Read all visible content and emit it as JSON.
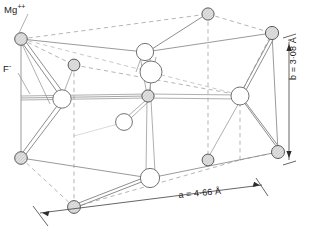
{
  "figure": {
    "labels": {
      "cation": "Mg",
      "cation_charge": "++",
      "anion": "F",
      "anion_charge": "-",
      "axis_a": "a = 4·66 Å",
      "axis_a_symbol": "a",
      "axis_a_value": "4·66",
      "axis_a_unit": "Å",
      "axis_b": "b = 3·08 Å",
      "axis_b_symbol": "b",
      "axis_b_value": "3·08",
      "axis_b_unit": "Å"
    },
    "colors": {
      "cation_fill": "#d9d9d9",
      "cation_stroke": "#5a5a5a",
      "anion_fill": "#ffffff",
      "anion_stroke": "#6b6b6b",
      "bond": "#8e8e8e",
      "cell_edge_solid": "#8e8e8e",
      "cell_edge_dashed": "#a8a8a8",
      "leader": "#9a9a9a",
      "text": "#1b1b1b",
      "background": "#ffffff"
    },
    "atoms": {
      "cation_label": "Mg++ ion",
      "anion_label": "F- ion",
      "cation_radius": 6.2,
      "anion_radius": 9.0,
      "cation_count": 10,
      "anion_count": 6
    },
    "cell": {
      "shape": "tetragonal prism",
      "corners_front": [
        "top-left",
        "top-right",
        "bottom-right",
        "bottom-left"
      ],
      "corners_back": [
        "top-left",
        "top-right",
        "bottom-right",
        "bottom-left"
      ]
    }
  }
}
